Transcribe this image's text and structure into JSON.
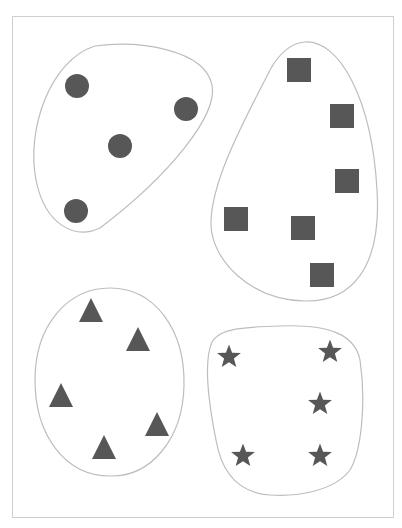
{
  "diagram": {
    "title": "",
    "colors": {
      "shape_fill": "#575757",
      "outline": "#bdbdbd",
      "frame_border": "#cfcfcf",
      "background": "#ffffff"
    },
    "groups": [
      {
        "name": "circles",
        "shape": "circle",
        "count": 4,
        "outline_path": "M 95 46 C 140 40, 205 50, 212 85 C 218 115, 170 175, 100 228 C 75 240, 45 225, 36 180 C 26 130, 50 60, 95 46 Z",
        "items": [
          {
            "x": 77,
            "y": 86
          },
          {
            "x": 186,
            "y": 109
          },
          {
            "x": 120,
            "y": 146
          },
          {
            "x": 76,
            "y": 211
          }
        ]
      },
      {
        "name": "squares",
        "shape": "square",
        "count": 6,
        "outline_path": "M 305 42 C 340 40, 372 100, 377 190 C 382 270, 350 302, 305 301 C 250 300, 212 260, 211 225 C 210 180, 250 110, 270 70 C 280 52, 292 43, 305 42 Z",
        "items": [
          {
            "x": 299,
            "y": 70
          },
          {
            "x": 342,
            "y": 116
          },
          {
            "x": 347,
            "y": 181
          },
          {
            "x": 236,
            "y": 219
          },
          {
            "x": 303,
            "y": 228
          },
          {
            "x": 322,
            "y": 275
          }
        ]
      },
      {
        "name": "triangles",
        "shape": "triangle",
        "count": 5,
        "outline_path": "M 110 288 C 155 288, 185 330, 184 385 C 183 440, 150 477, 110 476 C 65 476, 35 435, 35 380 C 35 325, 68 288, 110 288 Z",
        "items": [
          {
            "x": 91,
            "y": 310
          },
          {
            "x": 138,
            "y": 339
          },
          {
            "x": 61,
            "y": 395
          },
          {
            "x": 157,
            "y": 424
          },
          {
            "x": 104,
            "y": 447
          }
        ]
      },
      {
        "name": "stars",
        "shape": "star",
        "count": 5,
        "outline_path": "M 280 326 C 330 324, 355 335, 360 360 C 366 400, 362 450, 350 470 C 335 490, 300 497, 270 495 C 240 493, 222 475, 216 440 C 208 400, 204 360, 212 342 C 220 328, 245 327, 280 326 Z",
        "items": [
          {
            "x": 229,
            "y": 357
          },
          {
            "x": 330,
            "y": 352
          },
          {
            "x": 320,
            "y": 404
          },
          {
            "x": 243,
            "y": 456
          },
          {
            "x": 320,
            "y": 456
          }
        ]
      }
    ]
  }
}
